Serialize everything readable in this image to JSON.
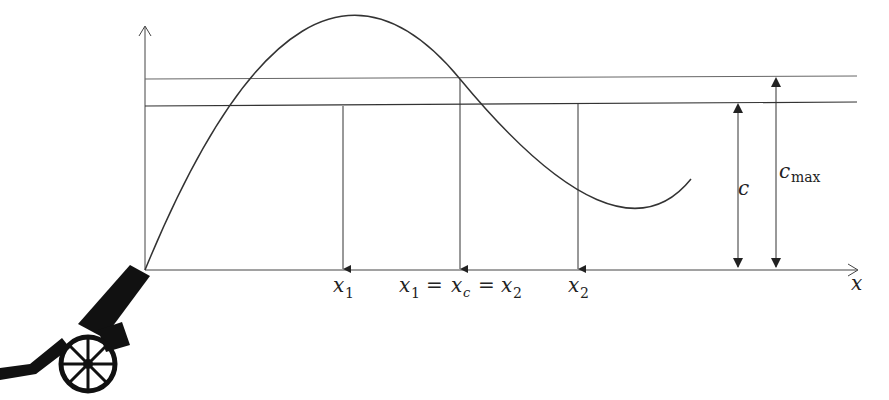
{
  "diagram": {
    "axes": {
      "x_label": "x",
      "y_label": ""
    },
    "labels": {
      "x1": "x",
      "x1_sub": "1",
      "x2": "x",
      "x2_sub": "2",
      "eq_x1": "x",
      "eq_x1_sub": "1",
      "eq_eq1": "=",
      "eq_xc": "x",
      "eq_xc_sub": "c",
      "eq_eq2": "=",
      "eq_x2": "x",
      "eq_x2_sub": "2",
      "c": "c",
      "cmax": "c",
      "cmax_sub": "max"
    },
    "colors": {
      "line": "#333333",
      "thin_line": "#555555",
      "cannon": "#111111"
    }
  }
}
